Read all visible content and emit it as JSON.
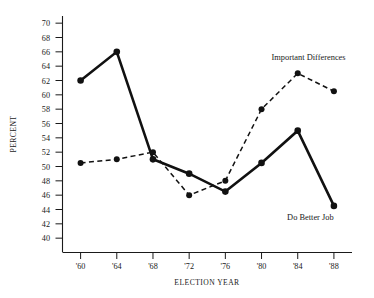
{
  "chart_data": {
    "type": "line",
    "title": "",
    "xlabel": "ELECTION YEAR",
    "ylabel": "PERCENT",
    "categories": [
      "'60",
      "'64",
      "'68",
      "'72",
      "'76",
      "'80",
      "'84",
      "'88"
    ],
    "x": [
      1960,
      1964,
      1968,
      1972,
      1976,
      1980,
      1984,
      1988
    ],
    "xlim": [
      1958,
      1990
    ],
    "ylim": [
      38,
      71
    ],
    "yticks": [
      40,
      42,
      44,
      46,
      48,
      50,
      52,
      54,
      56,
      58,
      60,
      62,
      64,
      66,
      68,
      70
    ],
    "ytick_labels": [
      "40",
      "42",
      "44",
      "46",
      "48",
      "50",
      "52",
      "54",
      "56",
      "58",
      "60",
      "62",
      "64",
      "66",
      "68",
      "70"
    ],
    "grid": false,
    "legend_position": "inline-annotation",
    "series": [
      {
        "name": "Do Better Job",
        "style": "solid",
        "color": "#111111",
        "marker": "filled-circle",
        "values": [
          62.0,
          66.0,
          51.0,
          49.0,
          46.5,
          50.5,
          55.0,
          44.5
        ]
      },
      {
        "name": "Important Differences",
        "style": "dashed",
        "color": "#111111",
        "marker": "filled-circle",
        "values": [
          50.5,
          51.0,
          52.0,
          46.0,
          48.0,
          58.0,
          63.0,
          60.5
        ]
      }
    ],
    "annotations": [
      {
        "text": "Important Differences",
        "series": "Important Differences",
        "x": 1985.2,
        "y": 64.9
      },
      {
        "text": "Do Better Job",
        "series": "Do Better Job",
        "x": 1985.4,
        "y": 42.6
      }
    ]
  }
}
